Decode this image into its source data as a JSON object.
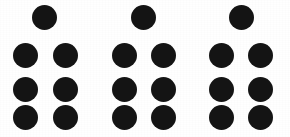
{
  "image": {
    "title": "Dot pattern stimulus",
    "description": "Three identical clusters of black dots on a white background",
    "width": 290,
    "height": 137,
    "background_color": "#ffffff",
    "dot_color": "#141414",
    "group_count": 3,
    "dots_per_group": 7,
    "total_dots": 21,
    "dot_diameter": 25,
    "arrangement": "one dot centered above three rows of two dots"
  },
  "chart_data": {
    "type": "scatter",
    "xlabel": "",
    "ylabel": "",
    "xlim": [
      0,
      290
    ],
    "ylim": [
      0,
      137
    ],
    "grid": false,
    "legend": "none",
    "marker": "filled-circle",
    "marker_size": 25,
    "marker_color": "#141414",
    "series": [
      {
        "name": "group-1",
        "points": [
          {
            "x": 44,
            "y": 17
          },
          {
            "x": 25,
            "y": 55
          },
          {
            "x": 65,
            "y": 55
          },
          {
            "x": 25,
            "y": 89
          },
          {
            "x": 65,
            "y": 89
          },
          {
            "x": 25,
            "y": 117
          },
          {
            "x": 65,
            "y": 117
          }
        ]
      },
      {
        "name": "group-2",
        "points": [
          {
            "x": 143,
            "y": 17
          },
          {
            "x": 124,
            "y": 55
          },
          {
            "x": 163,
            "y": 55
          },
          {
            "x": 124,
            "y": 89
          },
          {
            "x": 163,
            "y": 89
          },
          {
            "x": 124,
            "y": 117
          },
          {
            "x": 163,
            "y": 117
          }
        ]
      },
      {
        "name": "group-3",
        "points": [
          {
            "x": 241,
            "y": 17
          },
          {
            "x": 221,
            "y": 55
          },
          {
            "x": 260,
            "y": 55
          },
          {
            "x": 221,
            "y": 89
          },
          {
            "x": 260,
            "y": 89
          },
          {
            "x": 221,
            "y": 117
          },
          {
            "x": 260,
            "y": 117
          }
        ]
      }
    ]
  }
}
